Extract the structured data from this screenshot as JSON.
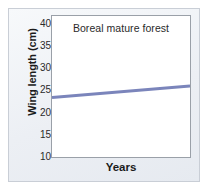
{
  "panel": {
    "background_color": "#eef1f6",
    "border_color": "#c9ced6"
  },
  "chart_data": {
    "type": "line",
    "title": "Boreal mature forest",
    "xlabel": "Years",
    "ylabel": "Wing length (cm)",
    "ylim": [
      10,
      42
    ],
    "yticks": [
      40,
      35,
      30,
      25,
      20,
      15,
      10
    ],
    "ytick_labels": [
      "40",
      "35",
      "30",
      "25",
      "20",
      "15",
      "10"
    ],
    "xlim": [
      0,
      1
    ],
    "xticks": [],
    "xtick_labels": [],
    "grid": false,
    "legend": null,
    "series": [
      {
        "name": "Boreal mature forest",
        "color": "#7b85bb",
        "line_width": 3,
        "x": [
          0,
          1
        ],
        "values": [
          23.5,
          26.1
        ]
      }
    ],
    "annotations": []
  },
  "axis": {
    "y_title": "Wing length (cm)",
    "x_title": "Years",
    "tick_color": "#8a8f98",
    "frame_color": "#9aa0a8"
  },
  "plot_title": "Boreal mature forest"
}
